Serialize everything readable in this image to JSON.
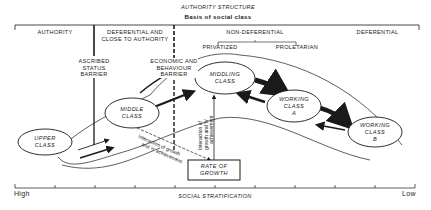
{
  "header": {
    "title": "AUTHORITY STRUCTURE",
    "subtitle": "Basis of social class"
  },
  "authority_segments": {
    "authority": "AUTHORITY",
    "deferential_close_line1": "DEFERENTIAL AND",
    "deferential_close_line2": "CLOSE TO AUTHORITY",
    "non_deferential": "NON-DEFERENTIAL",
    "privatized": "PRIVATIZED",
    "proletarian": "PROLETARIAN",
    "deferential": "DEFERENTIAL"
  },
  "barriers": {
    "ascribed_line1": "ASCRIBED",
    "ascribed_line2": "STATUS",
    "ascribed_line3": "BARRIER",
    "economic_line1": "ECONOMIC AND",
    "economic_line2": "BEHAVIOUR",
    "economic_line3": "BARRIER"
  },
  "classes": {
    "upper_line1": "UPPER",
    "upper_line2": "CLASS",
    "middle_line1": "MIDDLE",
    "middle_line2": "CLASS",
    "middling_line1": "MIDDLING",
    "middling_line2": "CLASS",
    "working_a_line1": "WORKING",
    "working_a_line2": "CLASS",
    "working_a_line3": "A",
    "working_b_line1": "WORKING",
    "working_b_line2": "CLASS",
    "working_b_line3": "B"
  },
  "annotations": {
    "diag_line1": "Interaction of growth",
    "diag_line2": "and 'n' achievement",
    "vert_line1": "Interaction of",
    "vert_line2": "growth and 'n'",
    "vert_line3": "achievement"
  },
  "growth_box": {
    "line1": "RATE OF",
    "line2": "GROWTH"
  },
  "axis": {
    "label": "SOCIAL STRATIFICATION",
    "high": "High",
    "low": "Low",
    "ticks": 11
  }
}
